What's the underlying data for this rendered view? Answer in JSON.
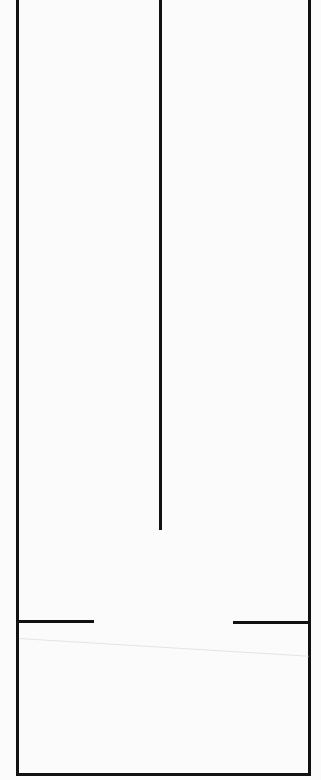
{
  "diagram": {
    "type": "floor-plan-outline",
    "background": "#fbfbfb",
    "line_color": "#111111",
    "outer_wall": {
      "left": 17,
      "right": 309,
      "top": 0,
      "bottom": 774,
      "thickness": 3
    },
    "center_divider": {
      "x": 160,
      "top": 0,
      "bottom": 530,
      "thickness": 3
    },
    "lower_partition": {
      "y": 621,
      "left_segment": {
        "x1": 17,
        "x2": 94
      },
      "right_segment": {
        "x1": 233,
        "x2": 309
      },
      "opening": {
        "x1": 94,
        "x2": 233
      }
    }
  }
}
